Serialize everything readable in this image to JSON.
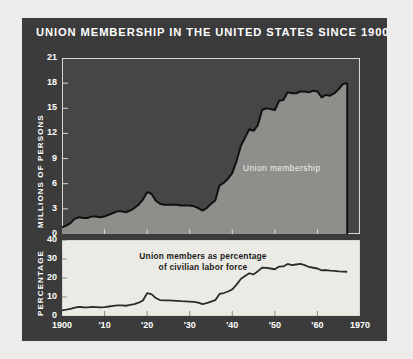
{
  "title": "UNION MEMBERSHIP IN THE UNITED STATES SINCE 1900",
  "colors": {
    "page_background": "#ececeb",
    "panel_background": "#3b3b3b",
    "top_plot_background": "#464646",
    "top_area_fill": "#8e8e8a",
    "top_line": "#111111",
    "bottom_plot_background": "#eceae4",
    "bottom_line": "#2b2b2b",
    "text_light": "#ffffff",
    "text_dark": "#1c1c1c",
    "frame": "#d8d8d4"
  },
  "top_chart": {
    "ylabel": "MILLIONS OF PERSONS",
    "annotation": "Union membership",
    "yticks": [
      0,
      3,
      6,
      9,
      12,
      15,
      18,
      21
    ]
  },
  "bottom_chart": {
    "ylabel": "PERCENTAGE",
    "annotation_line1": "Union members as percentage",
    "annotation_line2": "of civilian labor force",
    "yticks": [
      0,
      10,
      20,
      30,
      40
    ]
  },
  "xticks": [
    {
      "value": 1900,
      "label": "1900"
    },
    {
      "value": 1910,
      "label": "'10"
    },
    {
      "value": 1920,
      "label": "'20"
    },
    {
      "value": 1930,
      "label": "'30"
    },
    {
      "value": 1940,
      "label": "'40"
    },
    {
      "value": 1950,
      "label": "'50"
    },
    {
      "value": 1960,
      "label": "'60"
    },
    {
      "value": 1970,
      "label": "1970"
    }
  ],
  "chart_data": [
    {
      "type": "area",
      "title": "Union membership",
      "xlabel": "",
      "ylabel": "MILLIONS OF PERSONS",
      "xlim": [
        1900,
        1970
      ],
      "ylim": [
        0,
        21
      ],
      "yticks": [
        0,
        3,
        6,
        9,
        12,
        15,
        18,
        21
      ],
      "xticks": [
        1900,
        1910,
        1920,
        1930,
        1940,
        1950,
        1960,
        1970
      ],
      "grid": false,
      "legend": "none",
      "x": [
        1900,
        1901,
        1902,
        1903,
        1904,
        1905,
        1906,
        1907,
        1908,
        1909,
        1910,
        1911,
        1912,
        1913,
        1914,
        1915,
        1916,
        1917,
        1918,
        1919,
        1920,
        1921,
        1922,
        1923,
        1924,
        1925,
        1926,
        1927,
        1928,
        1929,
        1930,
        1931,
        1932,
        1933,
        1934,
        1935,
        1936,
        1937,
        1938,
        1939,
        1940,
        1941,
        1942,
        1943,
        1944,
        1945,
        1946,
        1947,
        1948,
        1949,
        1950,
        1951,
        1952,
        1953,
        1954,
        1955,
        1956,
        1957,
        1958,
        1959,
        1960,
        1961,
        1962,
        1963,
        1964,
        1965,
        1966,
        1967
      ],
      "values": [
        0.8,
        1.0,
        1.3,
        1.8,
        2.0,
        1.9,
        1.9,
        2.1,
        2.1,
        2.0,
        2.1,
        2.3,
        2.5,
        2.7,
        2.7,
        2.6,
        2.8,
        3.1,
        3.5,
        4.1,
        5.0,
        4.8,
        4.0,
        3.6,
        3.5,
        3.5,
        3.5,
        3.5,
        3.4,
        3.4,
        3.4,
        3.3,
        3.1,
        2.8,
        3.1,
        3.6,
        4.0,
        5.8,
        6.1,
        6.6,
        7.3,
        8.7,
        10.5,
        11.5,
        12.5,
        12.3,
        13.0,
        14.8,
        15.0,
        14.9,
        14.8,
        15.9,
        16.0,
        16.9,
        16.8,
        16.8,
        17.0,
        17.0,
        16.9,
        17.1,
        17.0,
        16.3,
        16.6,
        16.5,
        16.8,
        17.3,
        17.9,
        18.0
      ],
      "annotations": [
        {
          "text": "Union membership",
          "x": 1948,
          "y": 8
        }
      ]
    },
    {
      "type": "line",
      "title": "Union members as percentage of civilian labor force",
      "xlabel": "",
      "ylabel": "PERCENTAGE",
      "xlim": [
        1900,
        1970
      ],
      "ylim": [
        0,
        40
      ],
      "yticks": [
        0,
        10,
        20,
        30,
        40
      ],
      "xticks": [
        1900,
        1910,
        1920,
        1930,
        1940,
        1950,
        1960,
        1970
      ],
      "grid": false,
      "legend": "none",
      "x": [
        1900,
        1901,
        1902,
        1903,
        1904,
        1905,
        1906,
        1907,
        1908,
        1909,
        1910,
        1911,
        1912,
        1913,
        1914,
        1915,
        1916,
        1917,
        1918,
        1919,
        1920,
        1921,
        1922,
        1923,
        1924,
        1925,
        1926,
        1927,
        1928,
        1929,
        1930,
        1931,
        1932,
        1933,
        1934,
        1935,
        1936,
        1937,
        1938,
        1939,
        1940,
        1941,
        1942,
        1943,
        1944,
        1945,
        1946,
        1947,
        1948,
        1949,
        1950,
        1951,
        1952,
        1953,
        1954,
        1955,
        1956,
        1957,
        1958,
        1959,
        1960,
        1961,
        1962,
        1963,
        1964,
        1965,
        1966,
        1967
      ],
      "values": [
        3.0,
        3.3,
        3.7,
        4.4,
        4.8,
        4.6,
        4.5,
        4.8,
        4.7,
        4.5,
        4.7,
        5.0,
        5.3,
        5.6,
        5.6,
        5.4,
        5.8,
        6.3,
        7.0,
        8.2,
        12.0,
        11.5,
        9.5,
        8.4,
        8.2,
        8.2,
        8.1,
        8.0,
        7.8,
        7.7,
        7.6,
        7.4,
        7.0,
        6.3,
        6.8,
        7.6,
        8.3,
        11.6,
        12.1,
        12.9,
        14.0,
        16.5,
        19.5,
        21.0,
        22.5,
        21.9,
        23.6,
        25.4,
        25.3,
        25.0,
        24.6,
        26.0,
        26.1,
        27.4,
        26.8,
        27.1,
        27.4,
        26.8,
        25.8,
        25.4,
        25.0,
        24.0,
        24.2,
        23.9,
        23.8,
        23.5,
        23.4,
        23.3
      ],
      "annotations": [
        {
          "text": "Union members as percentage of civilian labor force",
          "x": 1928,
          "y": 31
        }
      ]
    }
  ]
}
